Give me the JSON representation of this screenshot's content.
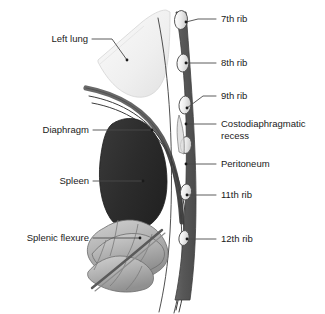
{
  "figure": {
    "width": 325,
    "height": 314,
    "background": "#ffffff"
  },
  "colors": {
    "lung_fill": "#f0f0f0",
    "lung_stroke": "#cfcfcf",
    "spleen_fill": "#303030",
    "spleen_stroke": "#1c1c1c",
    "colon_fill": "#b4b4b4",
    "colon_stroke": "#6d6d6d",
    "diaphragm_fill": "#595959",
    "rib_bone_fill": "#ededed",
    "rib_bone_stroke": "#4a4a4a",
    "intercostal_fill": "#5e5e5e",
    "membrane_stroke": "#3c3c3c",
    "label_text": "#1a1a1a",
    "leader_line": "#4a4a4a"
  },
  "labels": {
    "right": [
      {
        "id": "seventh-rib",
        "text": "7th rib",
        "text_x": 221,
        "text_y": 19,
        "leader": "M 216 19 L 198 19 L 186 22",
        "dot": {
          "x": 186,
          "y": 22
        }
      },
      {
        "id": "eighth-rib",
        "text": "8th rib",
        "text_x": 221,
        "text_y": 63,
        "leader": "M 216 63 L 186 63",
        "dot": {
          "x": 186,
          "y": 63
        }
      },
      {
        "id": "ninth-rib",
        "text": "9th rib",
        "text_x": 221,
        "text_y": 96,
        "leader": "M 216 96 L 203 96 L 187 108",
        "dot": {
          "x": 187,
          "y": 108
        }
      },
      {
        "id": "costodiaphragmatic-recess",
        "text": "Costodiaphragmatic",
        "text2": "recess",
        "text_x": 221,
        "text_y": 124,
        "text2_y": 136,
        "leader": "M 216 124 L 186 124",
        "dot": {
          "x": 186,
          "y": 124
        }
      },
      {
        "id": "peritoneum",
        "text": "Peritoneum",
        "text_x": 221,
        "text_y": 164,
        "leader": "M 216 164 L 186 164",
        "dot": {
          "x": 186,
          "y": 164
        }
      },
      {
        "id": "eleventh-rib",
        "text": "11th rib",
        "text_x": 221,
        "text_y": 195,
        "leader": "M 216 195 L 187 195",
        "dot": {
          "x": 187,
          "y": 195
        }
      },
      {
        "id": "twelfth-rib",
        "text": "12th rib",
        "text_x": 221,
        "text_y": 239,
        "leader": "M 216 239 L 187 239",
        "dot": {
          "x": 187,
          "y": 239
        }
      }
    ],
    "left": [
      {
        "id": "left-lung",
        "text": "Left lung",
        "text_x": 88,
        "text_y": 39,
        "leader": "M 92 39 L 112 39 L 127 60",
        "dot": {
          "x": 127,
          "y": 60
        }
      },
      {
        "id": "diaphragm",
        "text": "Diaphragm",
        "text_x": 89,
        "text_y": 130,
        "leader": "M 93 130 L 152 130",
        "dot": {
          "x": 152,
          "y": 130
        }
      },
      {
        "id": "spleen",
        "text": "Spleen",
        "text_x": 89,
        "text_y": 181,
        "leader": "M 93 181 L 143 181",
        "dot": {
          "x": 143,
          "y": 181
        }
      },
      {
        "id": "splenic-flexure",
        "text": "Splenic flexure",
        "text_x": 89,
        "text_y": 238,
        "leader": "M 93 238 L 140 238",
        "dot": {
          "x": 140,
          "y": 238
        }
      }
    ]
  },
  "structures": {
    "lung": {
      "name": "Left lung",
      "description": "Lower lobe of left lung, light gray rounded mass in upper region"
    },
    "spleen": {
      "name": "Spleen",
      "description": "Dark ovoid organ below diaphragm"
    },
    "colon": {
      "name": "Splenic flexure",
      "description": "Haustrated colon segments at lower left"
    },
    "diaphragm": {
      "name": "Diaphragm",
      "description": "Thick curved muscular band"
    },
    "peritoneum": {
      "name": "Peritoneum",
      "description": "Thin membrane lines following body wall"
    },
    "rib_column": {
      "name": "Rib cage in cross-section",
      "ribs": [
        "7th rib",
        "8th rib",
        "9th rib",
        "11th rib",
        "12th rib"
      ],
      "description": "Alternating cut rib cross-sections and intercostal muscle segments"
    }
  }
}
